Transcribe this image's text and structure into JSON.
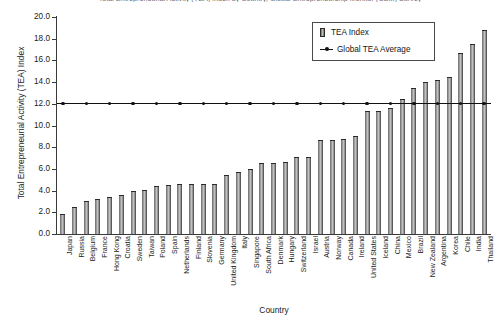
{
  "chart_data": {
    "type": "bar",
    "title": "Total Entrepreneurial Activity (TEA) Index by Country, Global Entrepreneurship Monitor (GEM) Survey",
    "xlabel": "Country",
    "ylabel": "Total Entrepreneurial Activity (TEA) Index",
    "ylim": [
      0.0,
      20.0
    ],
    "ytick_labels": [
      "20.0",
      "18.0",
      "16.0",
      "14.0",
      "12.0",
      "10.0",
      "8.0",
      "6.0",
      "4.0",
      "2.0",
      "0.0"
    ],
    "ytick_values": [
      20.0,
      18.0,
      16.0,
      14.0,
      12.0,
      10.0,
      8.0,
      6.0,
      4.0,
      2.0,
      0.0
    ],
    "grid": false,
    "legend_position": "top-right",
    "legend": [
      "TEA Index",
      "Global TEA Average"
    ],
    "categories": [
      "Japan",
      "Russia",
      "Belgium",
      "France",
      "Hong Kong",
      "Croatia",
      "Sweden",
      "Taiwan",
      "Poland",
      "Spain",
      "Netherlands",
      "Finland",
      "Slovenia",
      "Germany",
      "United Kingdom",
      "Italy",
      "Singapore",
      "South Africa",
      "Denmark",
      "Hungary",
      "Switzerland",
      "Israel",
      "Austria",
      "Norway",
      "Canada",
      "Ireland",
      "United States",
      "Iceland",
      "China",
      "Mexico",
      "Brazil",
      "New Zealand",
      "Argentina",
      "Korea",
      "Chile",
      "India",
      "Thailand"
    ],
    "series": [
      {
        "name": "TEA Index",
        "values": [
          1.8,
          2.5,
          3.0,
          3.2,
          3.4,
          3.6,
          4.0,
          4.1,
          4.4,
          4.5,
          4.6,
          4.6,
          4.6,
          4.6,
          5.4,
          5.7,
          6.0,
          6.5,
          6.5,
          6.6,
          7.1,
          7.1,
          8.7,
          8.7,
          8.8,
          9.0,
          11.3,
          11.3,
          11.6,
          12.4,
          13.5,
          14.0,
          14.2,
          14.5,
          16.7,
          17.5,
          18.8
        ]
      }
    ],
    "reference_line": {
      "name": "Global TEA Average",
      "value": 12.0,
      "style": "line-with-markers",
      "color": "#111111"
    },
    "colors": {
      "bar_fill": "#8e8e8e",
      "bar_edge": "#2b2b2b",
      "axis": "#3a3a3a",
      "text": "#1b1b1b",
      "average_line": "#111111",
      "background": "#ffffff"
    }
  }
}
